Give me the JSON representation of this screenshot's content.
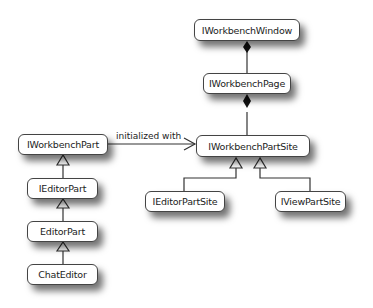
{
  "diagram": {
    "type": "UML class diagram",
    "nodes": {
      "workbench_window": "IWorkbenchWindow",
      "workbench_page": "IWorkbenchPage",
      "workbench_part_site": "IWorkbenchPartSite",
      "workbench_part": "IWorkbenchPart",
      "editor_part_iface": "IEditorPart",
      "editor_part": "EditorPart",
      "chat_editor": "ChatEditor",
      "editor_part_site": "IEditorPartSite",
      "view_part_site": "IViewPartSite"
    },
    "edges": [
      {
        "from": "IWorkbenchWindow",
        "to": "IWorkbenchPage",
        "kind": "composition"
      },
      {
        "from": "IWorkbenchPage",
        "to": "IWorkbenchPartSite",
        "kind": "composition"
      },
      {
        "from": "IWorkbenchPart",
        "to": "IWorkbenchPartSite",
        "kind": "association",
        "label": "initialized with"
      },
      {
        "from": "IEditorPart",
        "to": "IWorkbenchPart",
        "kind": "generalization"
      },
      {
        "from": "EditorPart",
        "to": "IEditorPart",
        "kind": "generalization"
      },
      {
        "from": "ChatEditor",
        "to": "EditorPart",
        "kind": "generalization"
      },
      {
        "from": "IEditorPartSite",
        "to": "IWorkbenchPartSite",
        "kind": "generalization"
      },
      {
        "from": "IViewPartSite",
        "to": "IWorkbenchPartSite",
        "kind": "generalization"
      }
    ],
    "edge_labels": {
      "initialized_with": "initialized with"
    }
  }
}
